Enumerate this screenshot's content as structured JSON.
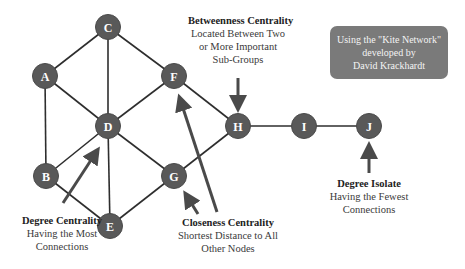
{
  "diagram": {
    "nodes": [
      {
        "id": "A",
        "x": 45,
        "y": 76
      },
      {
        "id": "B",
        "x": 46,
        "y": 176
      },
      {
        "id": "C",
        "x": 108,
        "y": 27
      },
      {
        "id": "D",
        "x": 108,
        "y": 126
      },
      {
        "id": "E",
        "x": 110,
        "y": 226
      },
      {
        "id": "F",
        "x": 174,
        "y": 76
      },
      {
        "id": "G",
        "x": 174,
        "y": 176
      },
      {
        "id": "H",
        "x": 238,
        "y": 126
      },
      {
        "id": "I",
        "x": 304,
        "y": 126
      },
      {
        "id": "J",
        "x": 369,
        "y": 126
      }
    ],
    "edges": [
      [
        "A",
        "C"
      ],
      [
        "A",
        "D"
      ],
      [
        "A",
        "B"
      ],
      [
        "C",
        "D"
      ],
      [
        "C",
        "F"
      ],
      [
        "B",
        "D"
      ],
      [
        "B",
        "E"
      ],
      [
        "D",
        "F"
      ],
      [
        "D",
        "G"
      ],
      [
        "D",
        "E"
      ],
      [
        "E",
        "G"
      ],
      [
        "F",
        "H"
      ],
      [
        "G",
        "H"
      ],
      [
        "H",
        "I"
      ],
      [
        "I",
        "J"
      ]
    ],
    "node_color": "#595959",
    "edge_color": "#2e2e2e"
  },
  "annotations": {
    "betweenness": {
      "title": "Betweenness Centrality",
      "line1": "Located Between Two",
      "line2": "or More Important",
      "line3": "Sub-Groups",
      "target_node": "H"
    },
    "degree": {
      "title": "Degree Centrality",
      "line1": "Having the Most",
      "line2": "Connections",
      "target_node": "D"
    },
    "closeness": {
      "title": "Closeness Centrality",
      "line1": "Shortest Distance to All",
      "line2": "Other Nodes",
      "target_nodes": [
        "F",
        "G"
      ]
    },
    "isolate": {
      "title": "Degree Isolate",
      "line1": "Having the Fewest",
      "line2": "Connections",
      "target_node": "J"
    }
  },
  "info_box": {
    "line1": "Using the \"Kite Network\"",
    "line2": "developed by",
    "line3": "David Krackhardt",
    "background": "#7a7a7a"
  }
}
